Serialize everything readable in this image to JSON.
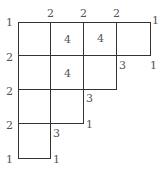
{
  "grid": {
    "cells": [
      {
        "x": 18,
        "y": 22,
        "w": 33,
        "h": 34
      },
      {
        "x": 50,
        "y": 22,
        "w": 34,
        "h": 34
      },
      {
        "x": 83,
        "y": 22,
        "w": 34,
        "h": 34
      },
      {
        "x": 116,
        "y": 22,
        "w": 35,
        "h": 34
      },
      {
        "x": 18,
        "y": 55,
        "w": 33,
        "h": 35
      },
      {
        "x": 50,
        "y": 55,
        "w": 34,
        "h": 35
      },
      {
        "x": 83,
        "y": 55,
        "w": 34,
        "h": 35
      },
      {
        "x": 18,
        "y": 89,
        "w": 33,
        "h": 35
      },
      {
        "x": 50,
        "y": 89,
        "w": 34,
        "h": 35
      },
      {
        "x": 18,
        "y": 123,
        "w": 33,
        "h": 36
      }
    ]
  },
  "labels": [
    {
      "t": "1",
      "x": 6,
      "y": 17
    },
    {
      "t": "2",
      "x": 47,
      "y": 8
    },
    {
      "t": "2",
      "x": 80,
      "y": 8
    },
    {
      "t": "2",
      "x": 113,
      "y": 8
    },
    {
      "t": "1",
      "x": 152,
      "y": 15
    },
    {
      "t": "4",
      "x": 64,
      "y": 34
    },
    {
      "t": "4",
      "x": 97,
      "y": 33
    },
    {
      "t": "2",
      "x": 6,
      "y": 52
    },
    {
      "t": "3",
      "x": 119,
      "y": 60
    },
    {
      "t": "1",
      "x": 150,
      "y": 60
    },
    {
      "t": "4",
      "x": 64,
      "y": 68
    },
    {
      "t": "2",
      "x": 6,
      "y": 86
    },
    {
      "t": "3",
      "x": 86,
      "y": 93
    },
    {
      "t": "2",
      "x": 6,
      "y": 120
    },
    {
      "t": "1",
      "x": 86,
      "y": 119
    },
    {
      "t": "3",
      "x": 53,
      "y": 128
    },
    {
      "t": "1",
      "x": 6,
      "y": 154
    },
    {
      "t": "1",
      "x": 53,
      "y": 154
    }
  ]
}
